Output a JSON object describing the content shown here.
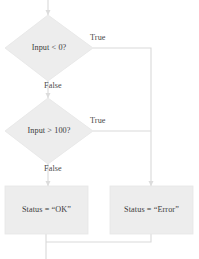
{
  "diagram": {
    "type": "flowchart",
    "colors": {
      "shape_fill": "#ededed",
      "shape_stroke": "#e4e4e4",
      "connector": "#d9d9d9",
      "text": "#3c3c3c",
      "background": "#ffffff"
    },
    "entry": {
      "name": "start-connector"
    },
    "nodes": [
      {
        "id": "decision-input-negative",
        "shape": "diamond",
        "label": "Input < 0?"
      },
      {
        "id": "decision-input-over-100",
        "shape": "diamond",
        "label": "Input > 100?"
      },
      {
        "id": "process-status-ok",
        "shape": "rectangle",
        "label": "Status = “OK”"
      },
      {
        "id": "process-status-error",
        "shape": "rectangle",
        "label": "Status = “Error”"
      }
    ],
    "edge_labels": {
      "decision1_true": "True",
      "decision1_false": "False",
      "decision2_true": "True",
      "decision2_false": "False"
    }
  }
}
